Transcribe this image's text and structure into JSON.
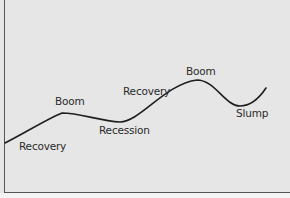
{
  "diagram": {
    "type": "business-cycle",
    "background_color": "#e6e6e6",
    "line_color": "#1f1f1f",
    "labels": [
      {
        "text": "Recovery",
        "x": 19,
        "y": 140
      },
      {
        "text": "Boom",
        "x": 55,
        "y": 95
      },
      {
        "text": "Recession",
        "x": 99,
        "y": 124
      },
      {
        "text": "Recovery",
        "x": 123,
        "y": 85
      },
      {
        "text": "Boom",
        "x": 186,
        "y": 65
      },
      {
        "text": "Slump",
        "x": 236,
        "y": 107
      }
    ]
  }
}
